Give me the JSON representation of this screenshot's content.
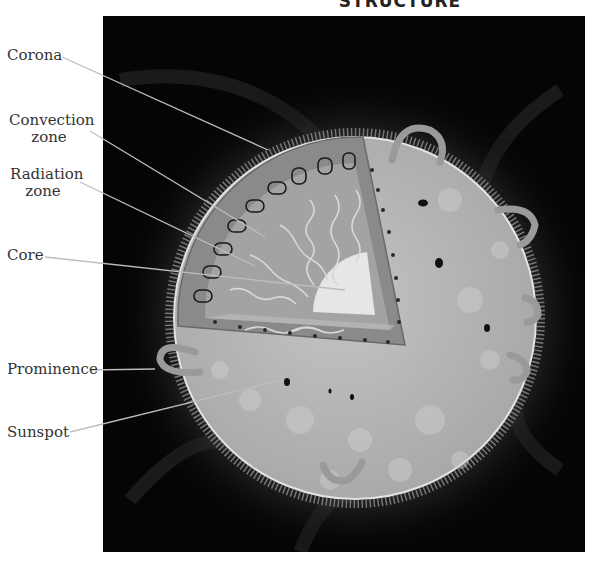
{
  "title": "STRUCTURE",
  "labels": {
    "corona": "Corona",
    "convection_line1": "Convection",
    "convection_line2": "zone",
    "radiation_line1": "Radiation",
    "radiation_line2": "zone",
    "core": "Core",
    "prominence": "Prominence",
    "sunspot": "Sunspot"
  },
  "colors": {
    "panel": "#050505",
    "photosphere": "#b9b9b9",
    "convection_zone": "#8a8a8a",
    "radiation_zone": "#a6a6a6",
    "core": "#e6e6e6",
    "leader_lines": "#bdbdbd"
  }
}
